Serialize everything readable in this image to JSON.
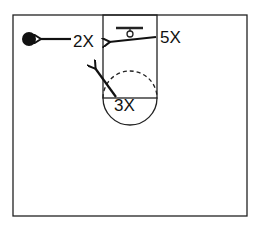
{
  "diagram": {
    "type": "basketball-half-court-drill",
    "colors": {
      "line": "#222222",
      "ink": "#111111",
      "background": "#ffffff"
    },
    "players": [
      {
        "id": "2X",
        "label": "2X",
        "x": 72,
        "y": 45
      },
      {
        "id": "3X",
        "label": "3X",
        "x": 112,
        "y": 106
      },
      {
        "id": "5X",
        "label": "5X",
        "x": 160,
        "y": 40
      }
    ],
    "ball": {
      "label": "ball",
      "x": 29,
      "y": 39
    },
    "movements": [
      {
        "from": "2X",
        "to": "ball-side",
        "description": "2X moves toward ball"
      },
      {
        "from": "5X",
        "to": "lane-left-block",
        "description": "5X cuts across lane"
      },
      {
        "from": "3X",
        "to": "lane-left-elbow",
        "description": "3X flashes up"
      }
    ]
  }
}
